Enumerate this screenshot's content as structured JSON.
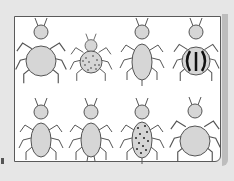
{
  "figure": {
    "colors": {
      "background": "#e6e6e6",
      "panel": "#ffffff",
      "border": "#5a5a5a",
      "bug_fill": "#d6d6d6",
      "bug_stroke": "#555555",
      "marking": "#222222"
    },
    "rows": [
      {
        "bugs": [
          {
            "id": 1,
            "body": "round-large",
            "pattern": "plain",
            "tail": false
          },
          {
            "id": 2,
            "body": "round-small",
            "pattern": "dotted",
            "tail": false
          },
          {
            "id": 3,
            "body": "oval",
            "pattern": "plain",
            "tail": true
          },
          {
            "id": 4,
            "body": "round",
            "pattern": "striped",
            "tail": false
          }
        ]
      },
      {
        "bugs": [
          {
            "id": 5,
            "body": "oval",
            "pattern": "plain",
            "tail": false
          },
          {
            "id": 6,
            "body": "oval",
            "pattern": "plain",
            "tail": false,
            "rear_legs": true
          },
          {
            "id": 7,
            "body": "oval",
            "pattern": "dotted",
            "tail": true
          },
          {
            "id": 8,
            "body": "round-large",
            "pattern": "plain",
            "tail": false
          }
        ]
      }
    ]
  }
}
